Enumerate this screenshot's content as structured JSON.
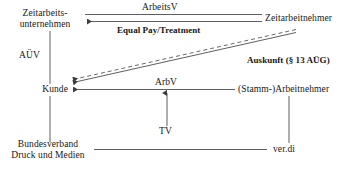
{
  "diagram": {
    "background_color": "#ffffff",
    "line_color": "#4d4d4d",
    "text_color": "#161616",
    "nodes": [
      {
        "id": "zeitarbeitsunternehmen",
        "line1": "Zeitarbeits-",
        "line2": "unternehmen"
      },
      {
        "id": "zeitarbeitnehmer",
        "line1": "Zeitarbeitnehmer",
        "line2": ""
      },
      {
        "id": "kunde",
        "line1": "Kunde",
        "line2": ""
      },
      {
        "id": "stamm-arbeitnehmer",
        "line1": "(Stamm-)Arbeitnehmer",
        "line2": ""
      },
      {
        "id": "bundesverband",
        "line1": "Bundesverband",
        "line2": "Druck und Medien"
      },
      {
        "id": "verdi",
        "line1": "ver.di",
        "line2": ""
      }
    ],
    "edge_labels": [
      {
        "id": "arbeitsv",
        "text": "ArbeitsV",
        "bold": false
      },
      {
        "id": "equal-pay",
        "text": "Equal Pay/Treatment",
        "bold": true
      },
      {
        "id": "auev",
        "text": "AÜV",
        "bold": false
      },
      {
        "id": "auskunft",
        "text": "Auskunft (§ 13 AÜG)",
        "bold": true
      },
      {
        "id": "arbv",
        "text": "ArbV",
        "bold": false
      },
      {
        "id": "tv",
        "text": "TV",
        "bold": false
      }
    ]
  }
}
